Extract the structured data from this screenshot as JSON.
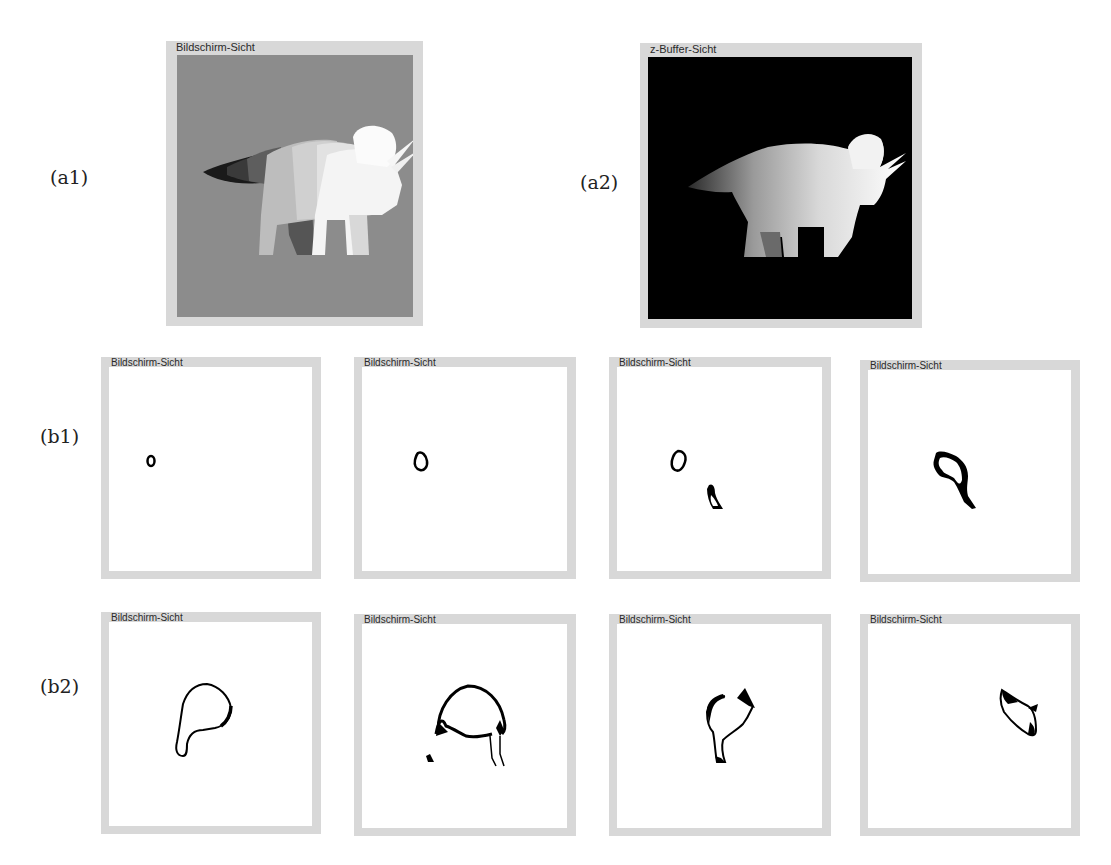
{
  "figure": {
    "rows": {
      "a1": {
        "label": "(a1)"
      },
      "a2": {
        "label": "(a2)"
      },
      "b1": {
        "label": "(b1)"
      },
      "b2": {
        "label": "(b2)"
      }
    },
    "panels": {
      "a1": {
        "title": "Bildschirm-Sicht",
        "background": "#8a8a8a",
        "content": "shaded triceratops rendering (depth-layered grayscale)"
      },
      "a2": {
        "title": "z-Buffer-Sicht",
        "background": "#000000",
        "content": "triceratops depth map (bright = near)"
      },
      "b1_1": {
        "title": "Bildschirm-Sicht",
        "content": "small outline contour (eye)"
      },
      "b1_2": {
        "title": "Bildschirm-Sicht",
        "content": "outline contour (eye)"
      },
      "b1_3": {
        "title": "Bildschirm-Sicht",
        "content": "eye contour and horn contour"
      },
      "b1_4": {
        "title": "Bildschirm-Sicht",
        "content": "head/frill contour slice"
      },
      "b2_1": {
        "title": "Bildschirm-Sicht",
        "content": "body and leg contour slice"
      },
      "b2_2": {
        "title": "Bildschirm-Sicht",
        "content": "torso contour slice with legs"
      },
      "b2_3": {
        "title": "Bildschirm-Sicht",
        "content": "rear body contour slice"
      },
      "b2_4": {
        "title": "Bildschirm-Sicht",
        "content": "tail contour slice"
      }
    },
    "colors": {
      "frame": "#d8d8d8",
      "screen_bg": "#8a8a8a",
      "zbuffer_bg": "#000000",
      "contour": "#000000"
    }
  }
}
